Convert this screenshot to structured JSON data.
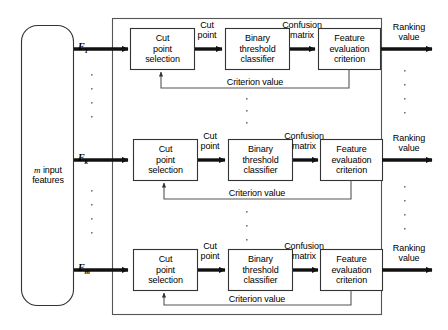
{
  "diagram": {
    "input_block": {
      "label_prefix": "m",
      "label_rest": " input\nfeatures"
    },
    "colors": {
      "line": "#1a1a1a",
      "background": "#ffffff",
      "box_fill": "#ffffff"
    },
    "rows": [
      {
        "feature_label": "F",
        "feature_sub": "1",
        "stage1": "Cut\npoint\nselection",
        "stage2": "Binary\nthreshold\nclassifier",
        "stage3": "Feature\nevaluation\ncriterion",
        "edge1": "Cut\npoint",
        "edge2": "Confusion\nmatrix",
        "feedback": "Criterion value",
        "output": "Ranking\nvalue"
      },
      {
        "feature_label": "F",
        "feature_sub": "k",
        "stage1": "Cut\npoint\nselection",
        "stage2": "Binary\nthreshold\nclassifier",
        "stage3": "Feature\nevaluation\ncriterion",
        "edge1": "Cut\npoint",
        "edge2": "Confusion\nmatrix",
        "feedback": "Criterion value",
        "output": "Ranking\nvalue"
      },
      {
        "feature_label": "F",
        "feature_sub": "m",
        "stage1": "Cut\npoint\nselection",
        "stage2": "Binary\nthreshold\nclassifier",
        "stage3": "Feature\nevaluation\ncriterion",
        "edge1": "Cut\npoint",
        "edge2": "Confusion\nmatrix",
        "feedback": "Criterion value",
        "output": "Ranking\nvalue"
      }
    ],
    "vertical_ellipsis": "·"
  }
}
